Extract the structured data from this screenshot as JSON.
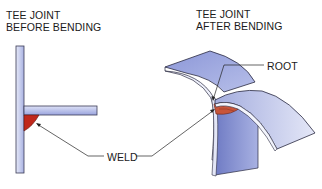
{
  "left_figure": {
    "title_line1": "TEE JOINT",
    "title_line2": "BEFORE BENDING"
  },
  "right_figure": {
    "title_line1": "TEE JOINT",
    "title_line2": "AFTER BENDING"
  },
  "callouts": {
    "root": "ROOT",
    "weld": "WELD"
  },
  "colors": {
    "plate_fill": "#c7cdef",
    "plate_dark": "#8f99d6",
    "plate_edge": "#e8ecfa",
    "weld_red": "#c0281c",
    "weld_bent": "#c8553a",
    "outline": "#2a2a40"
  }
}
